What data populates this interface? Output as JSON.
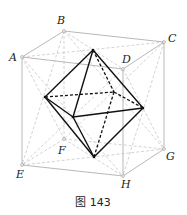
{
  "figure": {
    "caption": "图 143"
  },
  "cube": {
    "vertices": {
      "A": [
        22,
        57
      ],
      "B": [
        64,
        31
      ],
      "C": [
        164,
        42
      ],
      "D": [
        123,
        69
      ],
      "E": [
        22,
        165
      ],
      "F": [
        64,
        139
      ],
      "G": [
        164,
        149
      ],
      "H": [
        123,
        176
      ]
    },
    "labels": {
      "A": "A",
      "B": "B",
      "C": "C",
      "D": "D",
      "E": "E",
      "F": "F",
      "G": "G",
      "H": "H"
    },
    "edge_color": "#b8b8b8"
  },
  "octahedron": {
    "vertices": {
      "top": [
        93,
        50
      ],
      "left": [
        45,
        97
      ],
      "right": [
        143,
        108
      ],
      "front": [
        73,
        117
      ],
      "back": [
        114,
        92
      ],
      "bottom": [
        94,
        157
      ]
    },
    "edge_color": "#111111"
  },
  "colors": {
    "construction_dashed": "#c8c8c8",
    "solid_edge": "#111111",
    "cube_edge": "#b0b0b0"
  }
}
